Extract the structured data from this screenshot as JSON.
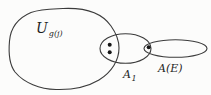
{
  "diagram": {
    "type": "set-membership-diagram",
    "background_color": "#fcfcfb",
    "stroke_color": "#3b3b3b",
    "dot_color": "#161616",
    "sets": [
      {
        "id": "universe",
        "label_main": "U",
        "label_sub": "g(j)",
        "description": "large universe blob, label inside top-left"
      },
      {
        "id": "a1",
        "label_main": "A",
        "label_sub": "1",
        "description": "ellipse overlapping right edge of universe, label below"
      },
      {
        "id": "ae",
        "label_main": "A(E)",
        "description": "flat ellipse overlapping right end of A1, label below"
      }
    ],
    "dots": {
      "universe_a1_overlap_count": 2,
      "a1_ae_overlap_count": 1
    }
  }
}
